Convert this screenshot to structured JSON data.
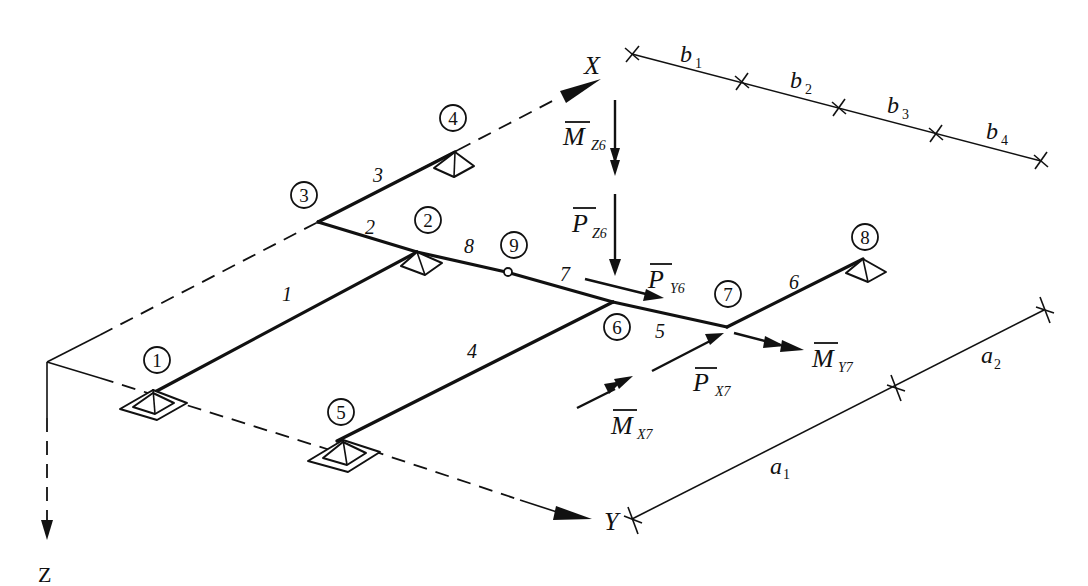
{
  "figure": {
    "axes": {
      "x_label": "X",
      "y_label": "Y",
      "z_label": "Z"
    },
    "nodes": [
      {
        "id": "1",
        "support": "fixed"
      },
      {
        "id": "2",
        "support": "pinned"
      },
      {
        "id": "3",
        "support": "none"
      },
      {
        "id": "4",
        "support": "pinned"
      },
      {
        "id": "5",
        "support": "fixed"
      },
      {
        "id": "6",
        "support": "none"
      },
      {
        "id": "7",
        "support": "none"
      },
      {
        "id": "8",
        "support": "pinned"
      },
      {
        "id": "9",
        "support": "hinge"
      }
    ],
    "members": [
      {
        "id": "1",
        "from": "1",
        "to": "2"
      },
      {
        "id": "2",
        "from": "3",
        "to": "2"
      },
      {
        "id": "3",
        "from": "3",
        "to": "4"
      },
      {
        "id": "4",
        "from": "5",
        "to": "6"
      },
      {
        "id": "5",
        "from": "6",
        "to": "7"
      },
      {
        "id": "6",
        "from": "7",
        "to": "8"
      },
      {
        "id": "7",
        "from": "9",
        "to": "6"
      },
      {
        "id": "8",
        "from": "2",
        "to": "9"
      }
    ],
    "loads": {
      "mz6": {
        "symbol": "M",
        "sub": "Z6",
        "type": "moment"
      },
      "pz6": {
        "symbol": "P",
        "sub": "Z6",
        "type": "force"
      },
      "py6": {
        "symbol": "P",
        "sub": "Y6",
        "type": "force"
      },
      "my7": {
        "symbol": "M",
        "sub": "Y7",
        "type": "moment"
      },
      "px7": {
        "symbol": "P",
        "sub": "X7",
        "type": "force"
      },
      "mx7": {
        "symbol": "M",
        "sub": "X7",
        "type": "moment"
      }
    },
    "dimensions": {
      "b": [
        {
          "sym": "b",
          "sub": "1"
        },
        {
          "sym": "b",
          "sub": "2"
        },
        {
          "sym": "b",
          "sub": "3"
        },
        {
          "sym": "b",
          "sub": "4"
        }
      ],
      "a": [
        {
          "sym": "a",
          "sub": "1"
        },
        {
          "sym": "a",
          "sub": "2"
        }
      ]
    }
  }
}
